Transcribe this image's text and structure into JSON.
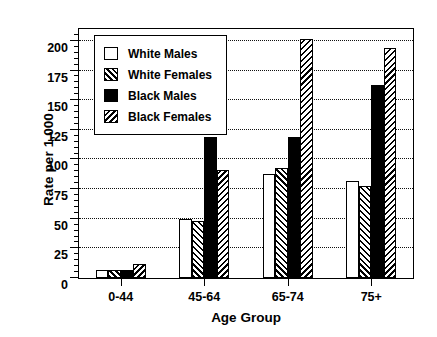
{
  "chart_data": {
    "type": "bar",
    "title": "",
    "xlabel": "Age Group",
    "ylabel": "Rate per 1,000",
    "categories": [
      "0-44",
      "45-64",
      "65-74",
      "75+"
    ],
    "series": [
      {
        "name": "White Males",
        "pattern": "solid-white",
        "values": [
          7,
          50,
          88,
          82
        ]
      },
      {
        "name": "White Females",
        "pattern": "hatch-fwd",
        "values": [
          7,
          48,
          93,
          78
        ]
      },
      {
        "name": "Black Males",
        "pattern": "solid-black",
        "values": [
          7,
          119,
          119,
          163
        ]
      },
      {
        "name": "Black Females",
        "pattern": "hatch-back",
        "values": [
          12,
          91,
          202,
          194
        ]
      }
    ],
    "ylim": [
      0,
      210
    ],
    "yticks": [
      0,
      25,
      50,
      75,
      100,
      125,
      150,
      175,
      200
    ],
    "ytick_labels": [
      "0",
      "25",
      "50",
      "75",
      "100",
      "125",
      "150",
      "175",
      "200"
    ],
    "gridlines": [
      25,
      50,
      75,
      100,
      125,
      150,
      175,
      200
    ],
    "grid": true,
    "grid_style": "dotted",
    "legend_position": "upper-left",
    "colors": {
      "foreground": "#000000",
      "background": "#ffffff"
    }
  }
}
